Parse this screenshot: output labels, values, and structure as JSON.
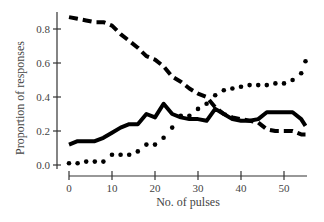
{
  "chart_data": {
    "type": "line",
    "title": "",
    "xlabel": "No. of pulses",
    "ylabel": "Proportion of responses",
    "xlim": [
      0,
      55
    ],
    "ylim": [
      0,
      0.87
    ],
    "xticks": [
      0,
      10,
      20,
      30,
      40,
      50
    ],
    "yticks": [
      0.0,
      0.2,
      0.4,
      0.6,
      0.8
    ],
    "ytick_labels": [
      "0.0",
      "0.2",
      "0.4",
      "0.6",
      "0.8"
    ],
    "xtick_labels": [
      "0",
      "10",
      "20",
      "30",
      "40",
      "50"
    ],
    "grid": false,
    "legend": null,
    "series": [
      {
        "name": "dashed",
        "style": "dashed",
        "x": [
          0,
          2,
          4,
          6,
          8,
          10,
          12,
          14,
          16,
          18,
          20,
          22,
          24,
          26,
          28,
          30,
          32,
          34,
          36,
          38,
          40,
          42,
          44,
          46,
          48,
          50,
          52,
          54,
          55
        ],
        "y": [
          0.87,
          0.86,
          0.85,
          0.84,
          0.84,
          0.82,
          0.77,
          0.73,
          0.69,
          0.64,
          0.62,
          0.58,
          0.52,
          0.49,
          0.45,
          0.42,
          0.4,
          0.34,
          0.3,
          0.28,
          0.27,
          0.26,
          0.25,
          0.21,
          0.2,
          0.2,
          0.2,
          0.18,
          0.18
        ]
      },
      {
        "name": "solid",
        "style": "solid",
        "x": [
          0,
          2,
          4,
          6,
          8,
          10,
          12,
          14,
          16,
          18,
          20,
          22,
          24,
          26,
          28,
          30,
          32,
          34,
          36,
          38,
          40,
          42,
          44,
          46,
          48,
          50,
          52,
          54,
          55
        ],
        "y": [
          0.12,
          0.14,
          0.14,
          0.14,
          0.16,
          0.19,
          0.22,
          0.24,
          0.24,
          0.3,
          0.28,
          0.36,
          0.3,
          0.28,
          0.27,
          0.27,
          0.26,
          0.33,
          0.3,
          0.27,
          0.26,
          0.26,
          0.27,
          0.31,
          0.31,
          0.31,
          0.31,
          0.27,
          0.23
        ]
      },
      {
        "name": "dotted",
        "style": "dotted",
        "x": [
          0,
          2,
          4,
          6,
          8,
          10,
          12,
          14,
          16,
          18,
          20,
          22,
          24,
          26,
          28,
          30,
          32,
          34,
          36,
          38,
          40,
          42,
          44,
          46,
          48,
          50,
          52,
          54,
          55
        ],
        "y": [
          0.01,
          0.01,
          0.02,
          0.02,
          0.02,
          0.06,
          0.06,
          0.06,
          0.08,
          0.12,
          0.12,
          0.16,
          0.22,
          0.29,
          0.29,
          0.33,
          0.36,
          0.41,
          0.44,
          0.45,
          0.46,
          0.47,
          0.47,
          0.47,
          0.48,
          0.48,
          0.5,
          0.54,
          0.61
        ]
      }
    ]
  }
}
